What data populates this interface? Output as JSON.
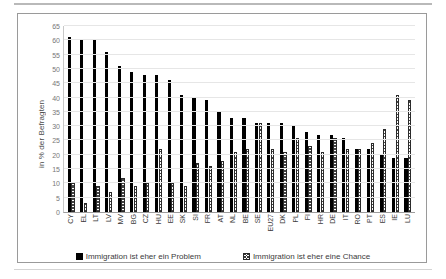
{
  "chart_data": {
    "type": "bar",
    "title": "",
    "xlabel": "",
    "ylabel": "in % der Befragten",
    "ylim": [
      0,
      65
    ],
    "ytick_step": 5,
    "yticks": [
      0,
      5,
      10,
      15,
      20,
      25,
      30,
      35,
      40,
      45,
      50,
      55,
      60,
      65
    ],
    "grid": true,
    "legend_position": "bottom",
    "categories": [
      "CY",
      "EL",
      "LT",
      "LV",
      "MV",
      "BG",
      "CZ",
      "HU",
      "EE",
      "SK",
      "SI",
      "FR",
      "AT",
      "NL",
      "BE",
      "SE",
      "EU27",
      "DK",
      "PL",
      "FI",
      "HR",
      "DE",
      "IT",
      "RO",
      "PT",
      "ES",
      "IE",
      "LU"
    ],
    "series": [
      {
        "name": "Immigration ist eher ein Problem",
        "style": "solid-black",
        "color": "#000000",
        "values": [
          61,
          60,
          60,
          56,
          51,
          49,
          48,
          48,
          46,
          41,
          40,
          39,
          35,
          33,
          33,
          31,
          31,
          31,
          30,
          28,
          27,
          27,
          26,
          22,
          22,
          20,
          19,
          19
        ]
      },
      {
        "name": "Immigration ist eher eine Chance",
        "style": "hatched",
        "color": "#ffffff",
        "values": [
          10,
          3,
          9,
          7,
          12,
          9,
          10,
          22,
          10,
          9,
          17,
          16,
          18,
          21,
          22,
          31,
          22,
          21,
          26,
          23,
          21,
          26,
          22,
          22,
          24,
          29,
          41,
          39
        ]
      }
    ]
  },
  "legend": {
    "items": [
      {
        "label": "Immigration ist eher ein Problem",
        "marker": "solid-square-icon"
      },
      {
        "label": "Immigration ist eher eine Chance",
        "marker": "hatched-square-icon"
      }
    ]
  },
  "axis": {
    "y_title": "in % der Befragten"
  }
}
